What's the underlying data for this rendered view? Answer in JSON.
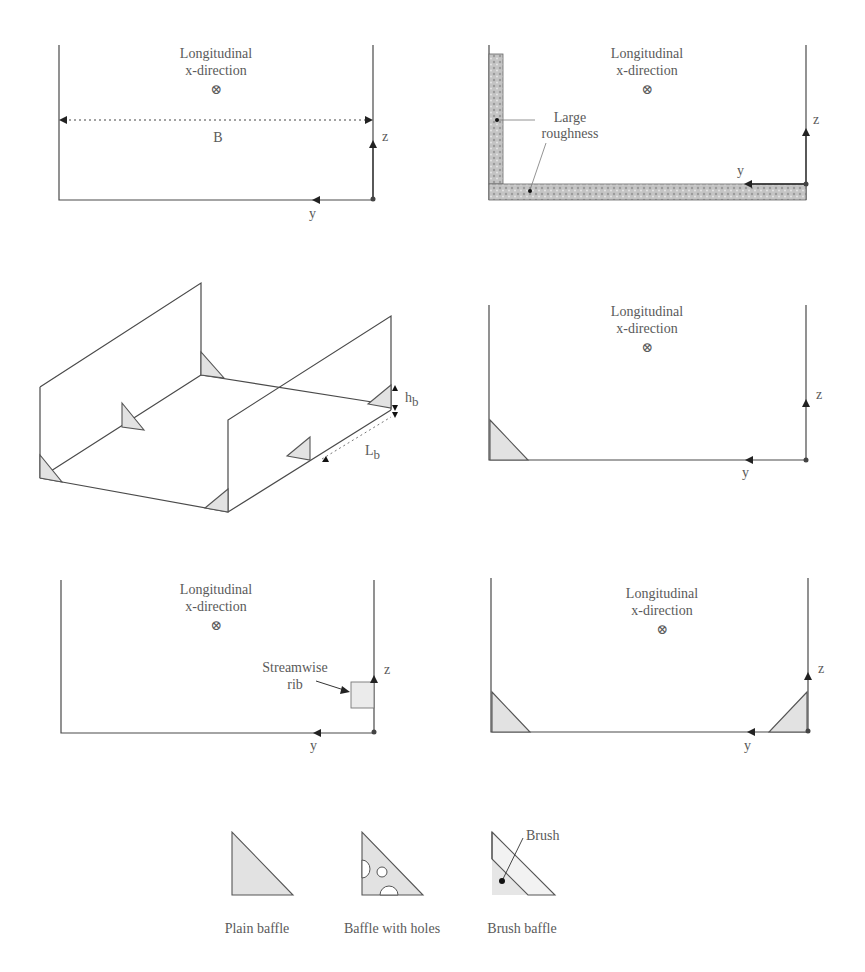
{
  "figure": {
    "panels": [
      {
        "id": "smooth-channel",
        "flow_label_line1": "Longitudinal",
        "flow_label_line2": "x-direction",
        "flow_symbol": "⊗",
        "width_label": "B",
        "axis_y": "y",
        "axis_z": "z"
      },
      {
        "id": "large-roughness-channel",
        "flow_label_line1": "Longitudinal",
        "flow_label_line2": "x-direction",
        "flow_symbol": "⊗",
        "callout_line1": "Large",
        "callout_line2": "roughness",
        "axis_y": "y",
        "axis_z": "z"
      },
      {
        "id": "isometric-baffled-channel",
        "height_label": "h",
        "height_sub": "b",
        "length_label": "L",
        "length_sub": "b"
      },
      {
        "id": "single-corner-baffle-channel",
        "flow_label_line1": "Longitudinal",
        "flow_label_line2": "x-direction",
        "flow_symbol": "⊗",
        "axis_y": "y",
        "axis_z": "z"
      },
      {
        "id": "streamwise-rib-channel",
        "flow_label_line1": "Longitudinal",
        "flow_label_line2": "x-direction",
        "flow_symbol": "⊗",
        "callout_line1": "Streamwise",
        "callout_line2": "rib",
        "axis_y": "y",
        "axis_z": "z"
      },
      {
        "id": "double-corner-baffle-channel",
        "flow_label_line1": "Longitudinal",
        "flow_label_line2": "x-direction",
        "flow_symbol": "⊗",
        "axis_y": "y",
        "axis_z": "z"
      }
    ],
    "legend": {
      "items": [
        {
          "label": "Plain baffle",
          "icon": "plain-baffle-icon"
        },
        {
          "label": "Baffle with holes",
          "icon": "holed-baffle-icon"
        },
        {
          "label": "Brush baffle",
          "icon": "brush-baffle-icon",
          "callout": "Brush"
        }
      ]
    },
    "colors": {
      "line": "#4a4a4a",
      "baffle_fill": "#e2e2e2",
      "roughness_fill": "#b8b8b8",
      "text": "#5a5a5a"
    }
  }
}
